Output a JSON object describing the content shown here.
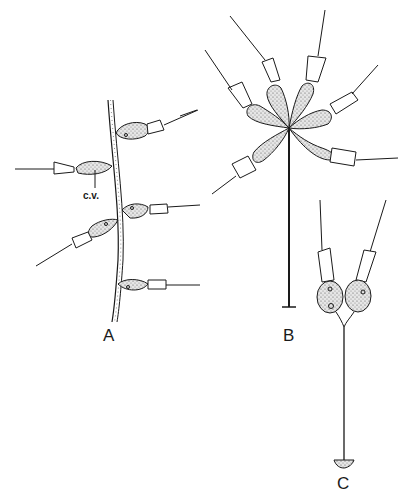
{
  "figure": {
    "panels": [
      {
        "id": "A",
        "label": "A",
        "description": "stalk with attached cells"
      },
      {
        "id": "B",
        "label": "B",
        "description": "radial colony on stalk"
      },
      {
        "id": "C",
        "label": "C",
        "description": "paired cells on branched stalk"
      }
    ],
    "annotations": {
      "cv_label": "c.v."
    },
    "colors": {
      "ink": "#1a1a1a",
      "cell_fill": "#d9d9d9",
      "background": "#ffffff"
    }
  }
}
